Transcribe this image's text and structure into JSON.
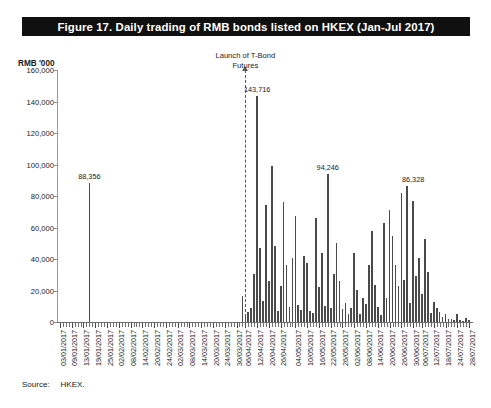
{
  "figure": {
    "title": "Figure 17.  Daily trading of RMB bonds listed on HKEX (Jan-Jul 2017)",
    "source_label": "Source:",
    "source_value": "HKEX."
  },
  "chart_data": {
    "type": "bar",
    "title": "Figure 17.  Daily trading of RMB bonds listed on HKEX (Jan-Jul 2017)",
    "xlabel": "",
    "ylabel": "RMB '000",
    "ylim": [
      0,
      160000
    ],
    "ytick_labels": [
      "0",
      "20,000",
      "40,000",
      "60,000",
      "80,000",
      "100,000",
      "120,000",
      "140,000",
      "160,000"
    ],
    "ytick_values": [
      0,
      20000,
      40000,
      60000,
      80000,
      100000,
      120000,
      140000,
      160000
    ],
    "grid": false,
    "legend": null,
    "annotations": [
      {
        "text": "Launch of T-Bond Futures",
        "text_lines": [
          "Launch of T-Bond",
          "Futures"
        ],
        "at_category": "06/04/2017",
        "style": "dashed-vertical-line-with-arrow"
      }
    ],
    "data_labels": [
      {
        "category": "17/01/2017",
        "value": 88356,
        "text": "88,356"
      },
      {
        "category": "12/04/2017",
        "value": 143716,
        "text": "143,716"
      },
      {
        "category": "19/05/2017",
        "value": 94246,
        "text": "94,246"
      },
      {
        "category": "30/06/2017",
        "value": 86328,
        "text": "86,328"
      }
    ],
    "xtick_labels": [
      "03/01/2017",
      "09/01/2017",
      "13/01/2017",
      "19/01/2017",
      "25/01/2017",
      "02/02/2017",
      "08/02/2017",
      "14/02/2017",
      "20/02/2017",
      "24/02/2017",
      "02/03/2017",
      "08/03/2017",
      "14/03/2017",
      "20/03/2017",
      "24/03/2017",
      "30/03/2017",
      "06/04/2017",
      "12/04/2017",
      "20/04/2017",
      "26/04/2017",
      "04/05/2017",
      "10/05/2017",
      "16/05/2017",
      "22/05/2017",
      "26/05/2017",
      "02/06/2017",
      "08/06/2017",
      "14/06/2017",
      "20/06/2017",
      "26/06/2017",
      "30/06/2017",
      "06/07/2017",
      "12/07/2017",
      "18/07/2017",
      "24/07/2017",
      "28/07/2017"
    ],
    "categories": [
      "03/01/2017",
      "04/01/2017",
      "05/01/2017",
      "06/01/2017",
      "09/01/2017",
      "10/01/2017",
      "11/01/2017",
      "12/01/2017",
      "13/01/2017",
      "16/01/2017",
      "17/01/2017",
      "18/01/2017",
      "19/01/2017",
      "20/01/2017",
      "23/01/2017",
      "24/01/2017",
      "25/01/2017",
      "26/01/2017",
      "27/01/2017",
      "01/02/2017",
      "02/02/2017",
      "03/02/2017",
      "06/02/2017",
      "07/02/2017",
      "08/02/2017",
      "09/02/2017",
      "10/02/2017",
      "13/02/2017",
      "14/02/2017",
      "15/02/2017",
      "16/02/2017",
      "17/02/2017",
      "20/02/2017",
      "21/02/2017",
      "22/02/2017",
      "23/02/2017",
      "24/02/2017",
      "27/02/2017",
      "28/02/2017",
      "01/03/2017",
      "02/03/2017",
      "03/03/2017",
      "06/03/2017",
      "07/03/2017",
      "08/03/2017",
      "09/03/2017",
      "10/03/2017",
      "13/03/2017",
      "14/03/2017",
      "15/03/2017",
      "16/03/2017",
      "17/03/2017",
      "20/03/2017",
      "21/03/2017",
      "22/03/2017",
      "23/03/2017",
      "24/03/2017",
      "27/03/2017",
      "28/03/2017",
      "29/03/2017",
      "30/03/2017",
      "31/03/2017",
      "05/04/2017",
      "06/04/2017",
      "07/04/2017",
      "10/04/2017",
      "11/04/2017",
      "12/04/2017",
      "13/04/2017",
      "18/04/2017",
      "19/04/2017",
      "20/04/2017",
      "21/04/2017",
      "24/04/2017",
      "25/04/2017",
      "26/04/2017",
      "27/04/2017",
      "28/04/2017",
      "02/05/2017",
      "03/05/2017",
      "04/05/2017",
      "05/05/2017",
      "08/05/2017",
      "09/05/2017",
      "10/05/2017",
      "11/05/2017",
      "12/05/2017",
      "15/05/2017",
      "16/05/2017",
      "17/05/2017",
      "18/05/2017",
      "19/05/2017",
      "22/05/2017",
      "23/05/2017",
      "24/05/2017",
      "25/05/2017",
      "26/05/2017",
      "29/05/2017",
      "31/05/2017",
      "01/06/2017",
      "02/06/2017",
      "05/06/2017",
      "06/06/2017",
      "07/06/2017",
      "08/06/2017",
      "09/06/2017",
      "12/06/2017",
      "13/06/2017",
      "14/06/2017",
      "15/06/2017",
      "16/06/2017",
      "19/06/2017",
      "20/06/2017",
      "21/06/2017",
      "22/06/2017",
      "23/06/2017",
      "26/06/2017",
      "27/06/2017",
      "28/06/2017",
      "29/06/2017",
      "30/06/2017",
      "04/07/2017",
      "05/07/2017",
      "06/07/2017",
      "07/07/2017",
      "10/07/2017",
      "11/07/2017",
      "12/07/2017",
      "13/07/2017",
      "14/07/2017",
      "17/07/2017",
      "18/07/2017",
      "19/07/2017",
      "20/07/2017",
      "21/07/2017",
      "24/07/2017",
      "25/07/2017",
      "26/07/2017",
      "27/07/2017",
      "28/07/2017"
    ],
    "values": [
      0,
      0,
      0,
      0,
      0,
      0,
      0,
      0,
      0,
      0,
      88356,
      0,
      0,
      0,
      0,
      0,
      0,
      0,
      0,
      0,
      0,
      0,
      0,
      0,
      0,
      0,
      0,
      0,
      0,
      0,
      0,
      0,
      0,
      0,
      0,
      0,
      0,
      0,
      0,
      0,
      0,
      0,
      0,
      0,
      0,
      0,
      0,
      0,
      0,
      0,
      0,
      0,
      0,
      0,
      0,
      0,
      0,
      0,
      0,
      0,
      0,
      0,
      16500,
      3800,
      6200,
      9000,
      30500,
      143716,
      47000,
      13500,
      74000,
      26000,
      99000,
      48000,
      6800,
      23000,
      76000,
      36000,
      9800,
      40500,
      67500,
      10500,
      7400,
      42000,
      37500,
      7200,
      5600,
      66000,
      22500,
      44000,
      10000,
      94246,
      8800,
      30500,
      50000,
      26000,
      8000,
      12000,
      5200,
      9000,
      44000,
      20500,
      4800,
      15000,
      11200,
      36500,
      58000,
      23500,
      9600,
      4600,
      63000,
      15500,
      71000,
      54500,
      36500,
      23000,
      82000,
      26500,
      86328,
      12000,
      77000,
      29500,
      40500,
      18000,
      53000,
      32000,
      5800,
      12500,
      9200,
      6200,
      3200,
      4800,
      2200,
      1800,
      1400,
      5200,
      1200,
      900,
      2600,
      1100
    ],
    "bar_color": "#4a4a4a"
  }
}
